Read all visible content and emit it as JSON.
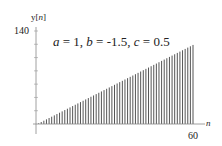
{
  "chart_data": {
    "type": "stem",
    "title": "a =  1, b = -1.5, c = 0.5",
    "title_parts": {
      "a_label": "a",
      "a_value": "1",
      "b_label": "b",
      "b_value": "-1.5",
      "c_label": "c",
      "c_value": "0.5"
    },
    "xlabel": "n",
    "ylabel": "y[n]",
    "y_tick_label_top": "140",
    "x_tick_label_right": "60",
    "xlim": [
      0,
      60
    ],
    "ylim": [
      0,
      140
    ],
    "grid": false,
    "legend": null,
    "x": [
      0,
      1,
      2,
      3,
      4,
      5,
      6,
      7,
      8,
      9,
      10,
      11,
      12,
      13,
      14,
      15,
      16,
      17,
      18,
      19,
      20,
      21,
      22,
      23,
      24,
      25,
      26,
      27,
      28,
      29,
      30,
      31,
      32,
      33,
      34,
      35,
      36,
      37,
      38,
      39,
      40,
      41,
      42,
      43,
      44,
      45,
      46,
      47,
      48,
      49,
      50,
      51,
      52,
      53,
      54,
      55,
      56,
      57,
      58,
      59,
      60
    ],
    "values": [
      0,
      1,
      3,
      5,
      7,
      9,
      11,
      13,
      15,
      17,
      19,
      21,
      23,
      25,
      27,
      29,
      31,
      33,
      35,
      37,
      39,
      41,
      43,
      45,
      47,
      49,
      51,
      53,
      55,
      57,
      59,
      61,
      63,
      65,
      67,
      69,
      71,
      73,
      75,
      77,
      79,
      81,
      83,
      85,
      87,
      89,
      91,
      93,
      95,
      97,
      99,
      101,
      103,
      105,
      107,
      109,
      111,
      113,
      115,
      117,
      119
    ]
  },
  "colors": {
    "stem": "#555555",
    "axis": "#888888",
    "text": "#222222"
  }
}
